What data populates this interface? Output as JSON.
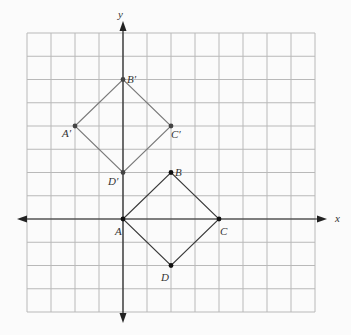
{
  "diagram": {
    "type": "coordinate-grid-transformation",
    "grid": {
      "x_range": [
        -4,
        8
      ],
      "y_range": [
        -4,
        8
      ],
      "step": 1,
      "origin_px": [
        123,
        219
      ],
      "unit_px": [
        24,
        23.25
      ],
      "line_color": "#b9b9b9",
      "axis_color": "#222222"
    },
    "axes": {
      "x_label": "x",
      "y_label": "y"
    },
    "figures": [
      {
        "name": "ABCD",
        "color": "#3a3a3a",
        "vertices": [
          {
            "label": "A",
            "x": 0,
            "y": 0,
            "label_dx": -8,
            "label_dy": 16
          },
          {
            "label": "B",
            "x": 2,
            "y": 2,
            "label_dx": 4,
            "label_dy": 3
          },
          {
            "label": "C",
            "x": 4,
            "y": 0,
            "label_dx": 1,
            "label_dy": 16
          },
          {
            "label": "D",
            "x": 2,
            "y": -2,
            "label_dx": -10,
            "label_dy": 15
          }
        ]
      },
      {
        "name": "A'B'C'D'",
        "color": "#7a7a7a",
        "vertices": [
          {
            "label": "A′",
            "x": -2,
            "y": 4,
            "label_dx": -13,
            "label_dy": 11
          },
          {
            "label": "B′",
            "x": 0,
            "y": 6,
            "label_dx": 4,
            "label_dy": 3
          },
          {
            "label": "C′",
            "x": 2,
            "y": 4,
            "label_dx": 0,
            "label_dy": 12
          },
          {
            "label": "D′",
            "x": 0,
            "y": 2,
            "label_dx": -15,
            "label_dy": 12
          }
        ]
      }
    ]
  }
}
